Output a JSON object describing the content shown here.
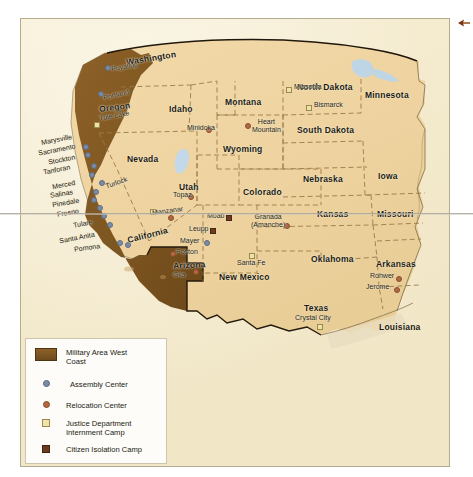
{
  "map": {
    "title": "Japanese American Internment — Military Area West Coast",
    "colors": {
      "military_area": "#7d5520",
      "land": "#f0d6a3",
      "paper": "#f3e9cb",
      "water": "#bcd4e6",
      "border": "#8a6b3a",
      "assembly_center": "#7b8ca6",
      "relocation_center": "#b3673f",
      "justice_camp": "#f0e3a9",
      "isolation_camp": "#6b3a20"
    },
    "states": [
      {
        "name": "Washington"
      },
      {
        "name": "Oregon"
      },
      {
        "name": "California"
      },
      {
        "name": "Nevada"
      },
      {
        "name": "Idaho"
      },
      {
        "name": "Montana"
      },
      {
        "name": "Wyoming"
      },
      {
        "name": "Utah"
      },
      {
        "name": "Colorado"
      },
      {
        "name": "Arizona"
      },
      {
        "name": "New Mexico"
      },
      {
        "name": "North Dakota"
      },
      {
        "name": "South Dakota"
      },
      {
        "name": "Nebraska"
      },
      {
        "name": "Kansas"
      },
      {
        "name": "Oklahoma"
      },
      {
        "name": "Texas"
      },
      {
        "name": "Minnesota"
      },
      {
        "name": "Iowa"
      },
      {
        "name": "Missouri"
      },
      {
        "name": "Arkansas"
      },
      {
        "name": "Louisiana"
      }
    ],
    "sites": [
      {
        "name": "Puyallup",
        "type": "assembly_center"
      },
      {
        "name": "Portland",
        "type": "assembly_center"
      },
      {
        "name": "Marysville",
        "type": "assembly_center"
      },
      {
        "name": "Sacramento",
        "type": "assembly_center"
      },
      {
        "name": "Stockton",
        "type": "assembly_center"
      },
      {
        "name": "Tanforan",
        "type": "assembly_center"
      },
      {
        "name": "Merced",
        "type": "assembly_center"
      },
      {
        "name": "Salinas",
        "type": "assembly_center"
      },
      {
        "name": "Pinedale",
        "type": "assembly_center"
      },
      {
        "name": "Fresno",
        "type": "assembly_center"
      },
      {
        "name": "Tulare",
        "type": "assembly_center"
      },
      {
        "name": "Turlock",
        "type": "assembly_center"
      },
      {
        "name": "Santa Anita",
        "type": "assembly_center"
      },
      {
        "name": "Pomona",
        "type": "assembly_center"
      },
      {
        "name": "Mayer",
        "type": "assembly_center"
      },
      {
        "name": "Tule Lake",
        "type": "relocation_center"
      },
      {
        "name": "Minidoka",
        "type": "relocation_center"
      },
      {
        "name": "Heart Mountain",
        "type": "relocation_center"
      },
      {
        "name": "Topaz",
        "type": "relocation_center"
      },
      {
        "name": "Manzanar",
        "type": "relocation_center"
      },
      {
        "name": "Poston",
        "type": "relocation_center"
      },
      {
        "name": "Gila",
        "type": "relocation_center"
      },
      {
        "name": "Granada (Amanche)",
        "type": "relocation_center"
      },
      {
        "name": "Rohwer",
        "type": "relocation_center"
      },
      {
        "name": "Jerome",
        "type": "relocation_center"
      },
      {
        "name": "Missoula",
        "type": "justice_camp"
      },
      {
        "name": "Bismarck",
        "type": "justice_camp"
      },
      {
        "name": "Santa Fe",
        "type": "justice_camp"
      },
      {
        "name": "Crystal City",
        "type": "justice_camp"
      },
      {
        "name": "Moab",
        "type": "isolation_camp"
      },
      {
        "name": "Leupp",
        "type": "isolation_camp"
      }
    ]
  },
  "legend": {
    "items": [
      {
        "key": "military-area-swatch",
        "label": "Military Area West\nCoast"
      },
      {
        "key": "assembly-center-dot",
        "label": "Assembly Center"
      },
      {
        "key": "relocation-center-dot",
        "label": "Relocation Center"
      },
      {
        "key": "justice-camp-square",
        "label": "Justice Department\nInternment Camp"
      },
      {
        "key": "citizen-isolation-square",
        "label": "Citizen Isolation Camp"
      }
    ]
  },
  "labels": {
    "washington": "Washington",
    "oregon": "Oregon",
    "california": "California",
    "nevada": "Nevada",
    "idaho": "Idaho",
    "montana": "Montana",
    "wyoming": "Wyoming",
    "utah": "Utah",
    "colorado": "Colorado",
    "arizona": "Arizona",
    "new_mexico": "New Mexico",
    "north_dakota": "North Dakota",
    "south_dakota": "South Dakota",
    "nebraska": "Nebraska",
    "kansas": "Kansas",
    "oklahoma": "Oklahoma",
    "texas": "Texas",
    "minnesota": "Minnesota",
    "iowa": "Iowa",
    "missouri": "Missouri",
    "arkansas": "Arkansas",
    "louisiana": "Louisiana",
    "puyallup": "Puyallup",
    "portland": "Portland",
    "tule_lake": "Tule Lake",
    "marysville": "Marysville",
    "sacramento": "Sacramento",
    "stockton": "Stockton",
    "tanforan": "Tanforan",
    "merced": "Merced",
    "salinas": "Salinas",
    "pinedale": "Pinedale",
    "fresno": "Fresno",
    "tulare": "Tulare",
    "turlock": "Turlock",
    "santa_anita": "Santa Anita",
    "pomona": "Pomona",
    "manzanar": "Manzanar",
    "minidoka": "Minidoka",
    "missoula": "Missoula",
    "bismarck": "Bismarck",
    "heart_mountain": "Heart\nMountain",
    "topaz": "Topaz",
    "moab": "Moab",
    "leupp": "Leupp",
    "mayer": "Mayer",
    "poston": "Poston",
    "gila": "Gila",
    "santa_fe": "Santa Fe",
    "granada": "Granada\n(Amanche)",
    "rohwer": "Rohwer",
    "jerome": "Jerome",
    "crystal_city": "Crystal City"
  }
}
